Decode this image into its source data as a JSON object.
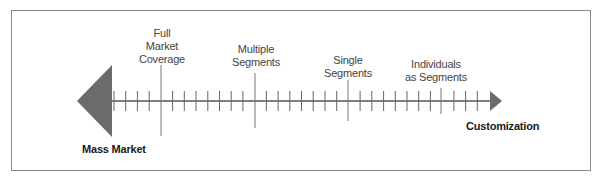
{
  "diagram": {
    "axis": {
      "left_end_label": "Mass Market",
      "right_end_label": "Customization",
      "line_color": "#555555",
      "left_triangle_color": "#6b6b6b",
      "arrow_color": "#6b6b6b"
    },
    "markers": [
      {
        "id": "full-market-coverage",
        "lines": [
          "Full",
          "Market",
          "Coverage"
        ],
        "x": 161
      },
      {
        "id": "multiple-segments",
        "lines": [
          "Multiple",
          "Segments"
        ],
        "x": 255
      },
      {
        "id": "single-segments",
        "lines": [
          "Single",
          "Segments"
        ],
        "x": 348
      },
      {
        "id": "individuals-as-segments",
        "lines": [
          "Individuals",
          "as Segments"
        ],
        "x": 441
      }
    ],
    "markers_text": {
      "m0": "Full\nMarket\nCoverage",
      "m1": "Multiple\nSegments",
      "m2": "Single\nSegments",
      "m3": "Individuals\nas Segments"
    }
  }
}
